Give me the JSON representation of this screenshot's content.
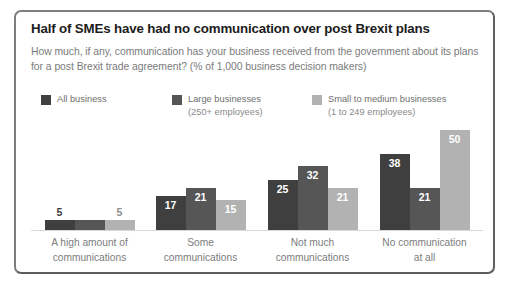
{
  "card": {
    "title": "Half of SMEs have had no communication over post Brexit plans",
    "subtitle": "How much, if any, communication has your business received from the government about its plans for a post Brexit trade agreement? (% of 1,000 business decision makers)"
  },
  "legend": {
    "position": "top-left",
    "items": [
      {
        "label": "All business",
        "sublabel": "",
        "color": "#3f3f3f"
      },
      {
        "label": "Large businesses",
        "sublabel": "(250+ employees)",
        "color": "#565656"
      },
      {
        "label": "Small to medium businesses",
        "sublabel": "(1 to 249 employees)",
        "color": "#b2b2b2"
      }
    ]
  },
  "chart_data": {
    "type": "bar",
    "title": "Half of SMEs have had no communication over post Brexit plans",
    "subtitle": "How much, if any, communication has your business received from the government about its plans for a post Brexit trade agreement? (% of 1,000 business decision makers)",
    "xlabel": "",
    "ylabel": "",
    "ylim": [
      0,
      50
    ],
    "grid": false,
    "legend_position": "top-left",
    "categories": [
      "A high amount of communications",
      "Some communications",
      "Not much communications",
      "No communication at all"
    ],
    "category_lines": [
      [
        "A high amount of",
        "communications"
      ],
      [
        "Some",
        "communications"
      ],
      [
        "Not much",
        "communications"
      ],
      [
        "No communication",
        "at all"
      ]
    ],
    "series": [
      {
        "name": "All business",
        "color": "#3f3f3f",
        "values": [
          5,
          17,
          25,
          38
        ],
        "labels": [
          "5",
          "17",
          "25",
          "38"
        ]
      },
      {
        "name": "Large businesses (250+ employees)",
        "color": "#565656",
        "values": [
          5,
          21,
          32,
          21
        ],
        "labels": [
          "",
          "21",
          "32",
          "21"
        ]
      },
      {
        "name": "Small to medium businesses (1 to 249 employees)",
        "color": "#b2b2b2",
        "values": [
          5,
          15,
          21,
          50
        ],
        "labels": [
          "5",
          "15",
          "21",
          "50"
        ]
      }
    ]
  }
}
